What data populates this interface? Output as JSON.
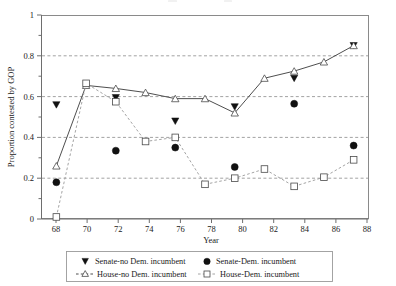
{
  "chart_data": {
    "type": "line",
    "title": "",
    "xlabel": "Year",
    "ylabel": "Proportion contested by GOP",
    "x": [
      68,
      70,
      72,
      74,
      76,
      78,
      80,
      82,
      84,
      86,
      88
    ],
    "categories": [
      "68",
      "70",
      "72",
      "74",
      "76",
      "78",
      "80",
      "82",
      "84",
      "86",
      "88"
    ],
    "xlim": [
      67,
      89
    ],
    "ylim": [
      0,
      1
    ],
    "ytick_labels": [
      "0",
      "0.2",
      "0.4",
      "0.6",
      "0.8",
      "1"
    ],
    "ytick_values": [
      0,
      0.2,
      0.4,
      0.6,
      0.8,
      1
    ],
    "grid": "horizontal dashed gridlines at 0.2, 0.4, 0.6, 0.8",
    "legend_position": "below plot",
    "series": [
      {
        "name": "Senate-no Dem. incumbent",
        "marker": "filled-triangle-down",
        "line": "none",
        "x": [
          68,
          72,
          76,
          80,
          84,
          88
        ],
        "values": [
          0.56,
          0.595,
          0.48,
          0.55,
          0.69,
          0.85
        ]
      },
      {
        "name": "Senate-Dem. incumbent",
        "marker": "filled-circle",
        "line": "none",
        "x": [
          68,
          72,
          76,
          80,
          84,
          88
        ],
        "values": [
          0.18,
          0.335,
          0.35,
          0.255,
          0.565,
          0.36
        ]
      },
      {
        "name": "House-no Dem. incumbent",
        "marker": "open-triangle-up",
        "line": "solid",
        "x": [
          68,
          70,
          72,
          74,
          76,
          78,
          80,
          82,
          84,
          86,
          88
        ],
        "values": [
          0.26,
          0.655,
          0.64,
          0.62,
          0.59,
          0.59,
          0.52,
          0.69,
          0.725,
          0.77,
          0.85
        ]
      },
      {
        "name": "House-Dem. incumbent",
        "marker": "open-square",
        "line": "dashed",
        "x": [
          68,
          70,
          72,
          74,
          76,
          78,
          80,
          82,
          84,
          86,
          88
        ],
        "values": [
          0.01,
          0.665,
          0.575,
          0.38,
          0.4,
          0.17,
          0.2,
          0.245,
          0.16,
          0.205,
          0.29
        ]
      }
    ]
  },
  "legend": {
    "entries": [
      {
        "label": "Senate-no Dem. incumbent",
        "marker": "filled-triangle-down"
      },
      {
        "label": "Senate-Dem. incumbent",
        "marker": "filled-circle"
      },
      {
        "label": "House-no Dem. incumbent",
        "marker": "open-triangle-up"
      },
      {
        "label": "House-Dem. incumbent",
        "marker": "open-square"
      }
    ]
  },
  "colors": {
    "solid_line": "#3a3a3a",
    "dashed_line": "#9a9a9a",
    "marker_fill": "#111111",
    "marker_open": "#ffffff",
    "grid": "#8a8a8a",
    "axis": "#6e6e6e",
    "background": "#ffffff"
  }
}
